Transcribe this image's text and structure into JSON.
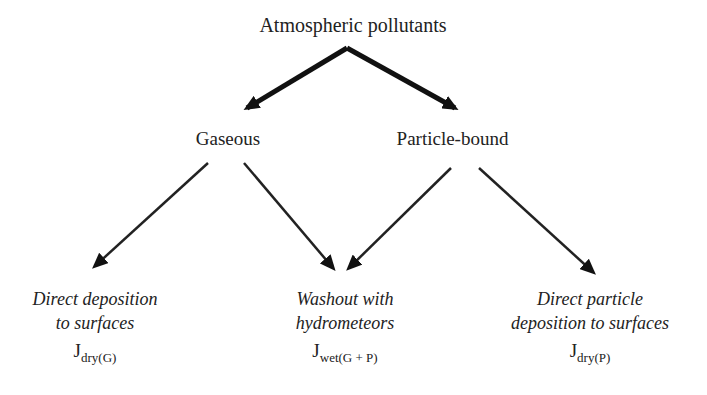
{
  "diagram": {
    "root": {
      "label": "Atmospheric pollutants"
    },
    "branches": [
      {
        "label": "Gaseous"
      },
      {
        "label": "Particle-bound"
      }
    ],
    "leaves": [
      {
        "line1": "Direct deposition",
        "line2": "to surfaces",
        "flux_main": "J",
        "flux_sub": "dry(G)"
      },
      {
        "line1": "Washout with",
        "line2": "hydrometeors",
        "flux_main": "J",
        "flux_sub": "wet(G + P)"
      },
      {
        "line1": "Direct particle",
        "line2": "deposition to surfaces",
        "flux_main": "J",
        "flux_sub": "dry(P)"
      }
    ],
    "edges": [
      {
        "from": "Atmospheric pollutants",
        "to": "Gaseous",
        "weight": "thick"
      },
      {
        "from": "Atmospheric pollutants",
        "to": "Particle-bound",
        "weight": "thick"
      },
      {
        "from": "Gaseous",
        "to": "Direct deposition to surfaces",
        "weight": "thin"
      },
      {
        "from": "Gaseous",
        "to": "Washout with hydrometeors",
        "weight": "thin"
      },
      {
        "from": "Particle-bound",
        "to": "Washout with hydrometeors",
        "weight": "thin"
      },
      {
        "from": "Particle-bound",
        "to": "Direct particle deposition to surfaces",
        "weight": "thin"
      }
    ],
    "colors": {
      "ink": "#222222",
      "background": "#ffffff"
    }
  }
}
